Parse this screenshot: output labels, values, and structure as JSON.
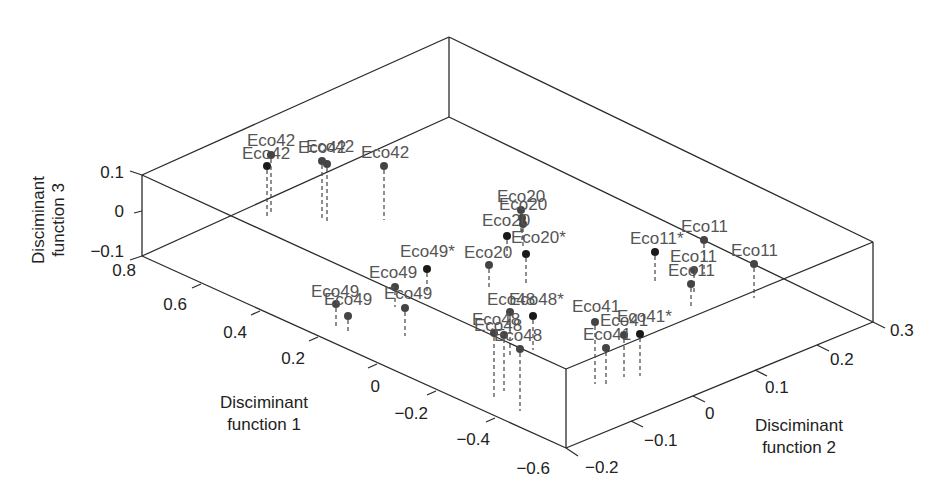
{
  "chart_data": {
    "type": "scatter3d",
    "title": "",
    "axes": {
      "x": {
        "label": "Disciminant function 1",
        "ticks": [
          "0.8",
          "0.6",
          "0.4",
          "0.2",
          "0",
          "−0.2",
          "−0.4",
          "−0.6"
        ],
        "range": [
          -0.6,
          0.8
        ]
      },
      "y": {
        "label": "Disciminant function 2",
        "ticks": [
          "−0.2",
          "−0.1",
          "0",
          "0.1",
          "0.2",
          "0.3"
        ],
        "range": [
          -0.2,
          0.3
        ]
      },
      "z": {
        "label": "Disciminant function 3",
        "ticks": [
          "0.1",
          "0",
          "−0.1"
        ],
        "range": [
          -0.1,
          0.1
        ]
      }
    },
    "axis_titles": {
      "x_line1": "Disciminant",
      "x_line2": "function 1",
      "y_line1": "Disciminant",
      "y_line2": "function 2",
      "z_line1": "Disciminant",
      "z_line2": "function 3"
    },
    "grid": false,
    "legend": null,
    "groups": [
      "Eco42",
      "Eco20",
      "Eco11",
      "Eco49",
      "Eco48",
      "Eco41"
    ],
    "points": [
      {
        "label": "Eco42",
        "px": 267,
        "py": 166,
        "stem": 48,
        "dark": true,
        "lx": 242,
        "ly": 159
      },
      {
        "label": "Eco42",
        "px": 271,
        "py": 155,
        "stem": 55,
        "dark": false,
        "lx": 247,
        "ly": 146
      },
      {
        "label": "Eco42",
        "px": 322,
        "py": 161,
        "stem": 56,
        "dark": false,
        "lx": 298,
        "ly": 153
      },
      {
        "label": "Eco42",
        "px": 327,
        "py": 164,
        "stem": 53,
        "dark": false,
        "lx": 306,
        "ly": 152
      },
      {
        "label": "Eco42",
        "px": 384,
        "py": 166,
        "stem": 50,
        "dark": false,
        "lx": 361,
        "ly": 158
      },
      {
        "label": "Eco20",
        "px": 521,
        "py": 210,
        "stem": 20,
        "dark": false,
        "lx": 497,
        "ly": 202
      },
      {
        "label": "Eco20",
        "px": 522,
        "py": 218,
        "stem": 18,
        "dark": false,
        "lx": 499,
        "ly": 210
      },
      {
        "label": "Eco20",
        "px": 523,
        "py": 224,
        "stem": 18,
        "dark": false,
        "lx": 482,
        "ly": 226
      },
      {
        "label": "Eco20*",
        "px": 507,
        "py": 236,
        "stem": 16,
        "dark": true,
        "lx": 511,
        "ly": 243
      },
      {
        "label": "Eco20",
        "px": 489,
        "py": 265,
        "stem": 20,
        "dark": false,
        "lx": 464,
        "ly": 258
      },
      {
        "label": "Eco20",
        "px": 526,
        "py": 254,
        "stem": 26,
        "dark": true,
        "lx": 0,
        "ly": 0,
        "hidden_label": true
      },
      {
        "label": "Eco11*",
        "px": 655,
        "py": 252,
        "stem": 28,
        "dark": true,
        "lx": 630,
        "ly": 244
      },
      {
        "label": "Eco11",
        "px": 704,
        "py": 240,
        "stem": 30,
        "dark": false,
        "lx": 681,
        "ly": 232
      },
      {
        "label": "Eco11",
        "px": 694,
        "py": 270,
        "stem": 20,
        "dark": false,
        "lx": 670,
        "ly": 262
      },
      {
        "label": "Eco11",
        "px": 691,
        "py": 284,
        "stem": 20,
        "dark": false,
        "lx": 668,
        "ly": 276
      },
      {
        "label": "Eco11",
        "px": 754,
        "py": 264,
        "stem": 30,
        "dark": false,
        "lx": 731,
        "ly": 256
      },
      {
        "label": "Eco49*",
        "px": 427,
        "py": 269,
        "stem": 18,
        "dark": true,
        "lx": 400,
        "ly": 257
      },
      {
        "label": "Eco49",
        "px": 395,
        "py": 287,
        "stem": 16,
        "dark": false,
        "lx": 369,
        "ly": 278
      },
      {
        "label": "Eco49",
        "px": 336,
        "py": 304,
        "stem": 20,
        "dark": false,
        "lx": 311,
        "ly": 297
      },
      {
        "label": "Eco49",
        "px": 348,
        "py": 316,
        "stem": 14,
        "dark": false,
        "lx": 324,
        "ly": 305
      },
      {
        "label": "Eco49",
        "px": 405,
        "py": 308,
        "stem": 24,
        "dark": false,
        "lx": 384,
        "ly": 299
      },
      {
        "label": "Eco48",
        "px": 510,
        "py": 312,
        "stem": 40,
        "dark": false,
        "lx": 487,
        "ly": 305
      },
      {
        "label": "Eco48*",
        "px": 533,
        "py": 316,
        "stem": 30,
        "dark": true,
        "lx": 509,
        "ly": 305
      },
      {
        "label": "Eco48",
        "px": 494,
        "py": 333,
        "stem": 60,
        "dark": false,
        "lx": 472,
        "ly": 325
      },
      {
        "label": "Eco48",
        "px": 504,
        "py": 335,
        "stem": 52,
        "dark": false,
        "lx": 474,
        "ly": 331
      },
      {
        "label": "Eco48",
        "px": 520,
        "py": 349,
        "stem": 58,
        "dark": false,
        "lx": 494,
        "ly": 341
      },
      {
        "label": "Eco41",
        "px": 595,
        "py": 322,
        "stem": 58,
        "dark": false,
        "lx": 572,
        "ly": 312
      },
      {
        "label": "Eco41",
        "px": 624,
        "py": 335,
        "stem": 38,
        "dark": false,
        "lx": 600,
        "ly": 326
      },
      {
        "label": "Eco41*",
        "px": 640,
        "py": 334,
        "stem": 38,
        "dark": true,
        "lx": 617,
        "ly": 322
      },
      {
        "label": "Eco41",
        "px": 606,
        "py": 348,
        "stem": 32,
        "dark": false,
        "lx": 583,
        "ly": 340
      }
    ]
  }
}
